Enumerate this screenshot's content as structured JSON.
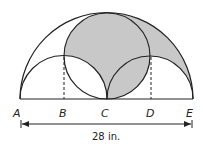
{
  "figure": {
    "points": [
      {
        "id": "A",
        "label": "A"
      },
      {
        "id": "B",
        "label": "B"
      },
      {
        "id": "C",
        "label": "C"
      },
      {
        "id": "D",
        "label": "D"
      },
      {
        "id": "E",
        "label": "E"
      }
    ],
    "dimension_label": "28 in.",
    "colors": {
      "stroke": "#222222",
      "shade": "#c8c8c8",
      "background": "#ffffff"
    }
  }
}
